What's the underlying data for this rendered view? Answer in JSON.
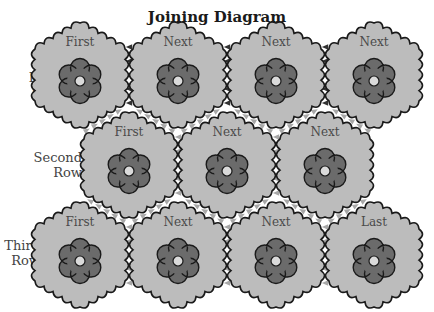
{
  "title": "Joining Diagram",
  "colors": {
    "hex_fill": "#bcbcbc",
    "hex_stroke": "#1a1a1a",
    "flower_fill": "#6b6b6b",
    "flower_center": "#dadada",
    "arrow_dark": "#333333",
    "arrow_light": "#a8a8a8"
  },
  "rows": [
    {
      "label_line1": "First",
      "label_line2": "Row",
      "motifs": [
        "First",
        "Next",
        "Next",
        "Next"
      ]
    },
    {
      "label_line1": "Second",
      "label_line2": "Row",
      "motifs": [
        "First",
        "Next",
        "Next"
      ]
    },
    {
      "label_line1": "Third",
      "label_line2": "Row",
      "motifs": [
        "First",
        "Next",
        "Next",
        "Last"
      ]
    }
  ]
}
